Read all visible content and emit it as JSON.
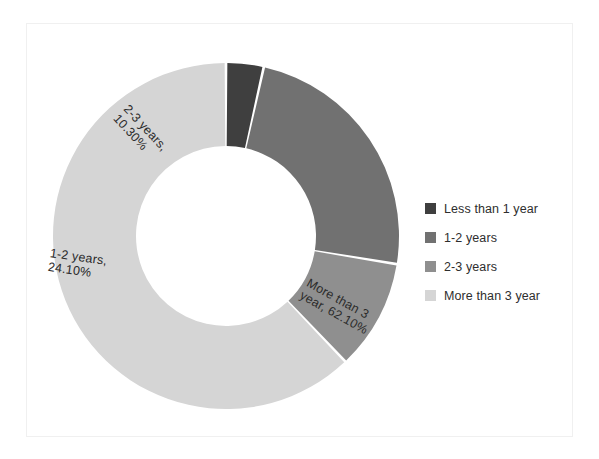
{
  "chart_data": {
    "type": "pie",
    "variant": "donut",
    "title": "",
    "xlabel": "",
    "ylabel": "",
    "grid": false,
    "legend_position": "right",
    "center_x": 199,
    "center_y": 212,
    "outer_radius": 173,
    "inner_radius": 90,
    "start_angle_deg": -90,
    "categories": [
      "Less than 1 year",
      "1-2 years",
      "2-3 years",
      "More than 3 year"
    ],
    "values": [
      3.5,
      24.1,
      10.3,
      62.1
    ],
    "value_unit": "%",
    "slices": [
      {
        "name": "Less than 1 year",
        "value": 3.5,
        "display_value": "3.50%",
        "color": "#3f3f3f",
        "label_shown": false,
        "label_text": ""
      },
      {
        "name": "1-2 years",
        "value": 24.1,
        "display_value": "24.10%",
        "color": "#717171",
        "label_shown": true,
        "label_text": "1-2 years, 24.10%",
        "label_line_1": "1-2 years,",
        "label_line_2": "24.10%"
      },
      {
        "name": "2-3 years",
        "value": 10.3,
        "display_value": "10.30%",
        "color": "#8f8f8f",
        "label_shown": true,
        "label_text": "2-3 years, 10.30%",
        "label_line_1": "2-3 years,",
        "label_line_2": "10.30%"
      },
      {
        "name": "More than 3 year",
        "value": 62.1,
        "display_value": "62.10%",
        "color": "#d5d5d5",
        "label_shown": true,
        "label_text": "More than 3 year, 62.10%",
        "label_line_1": "More than 3",
        "label_line_2": "year, 62.10%"
      }
    ]
  },
  "legend": {
    "items": [
      {
        "label": "Less than 1 year",
        "color": "#3f3f3f"
      },
      {
        "label": "1-2 years",
        "color": "#717171"
      },
      {
        "label": "2-3 years",
        "color": "#8f8f8f"
      },
      {
        "label": "More than 3 year",
        "color": "#d5d5d5"
      }
    ]
  },
  "frame": {
    "border_color": "#f0f0f0",
    "background": "#ffffff"
  }
}
